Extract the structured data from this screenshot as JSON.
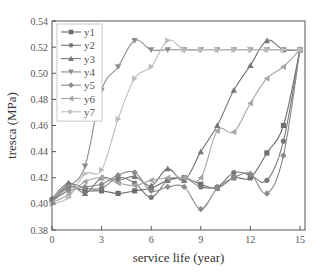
{
  "chart_data": {
    "type": "line",
    "title": "",
    "xlabel": "service life (year)",
    "ylabel": "tresca (MPa)",
    "xlim": [
      0,
      15.3
    ],
    "ylim": [
      0.38,
      0.54
    ],
    "xticks": [
      0,
      3,
      6,
      9,
      12,
      15
    ],
    "xtick_labels": [
      "0",
      "3",
      "6",
      "9",
      "12",
      "15"
    ],
    "yticks": [
      0.38,
      0.4,
      0.42,
      0.44,
      0.46,
      0.48,
      0.5,
      0.52,
      0.54
    ],
    "ytick_labels": [
      "0.38",
      "0.40",
      "0.42",
      "0.44",
      "0.46",
      "0.48",
      "0.50",
      "0.52",
      "0.54"
    ],
    "grid": false,
    "legend_position": "upper-left",
    "x": [
      0,
      1,
      2,
      3,
      4,
      5,
      6,
      7,
      8,
      9,
      10,
      11,
      12,
      13,
      14,
      15
    ],
    "series": [
      {
        "name": "y1",
        "marker": "square",
        "color": "#6e6e6e",
        "values": [
          0.403,
          0.413,
          0.41,
          0.41,
          0.408,
          0.41,
          0.412,
          0.418,
          0.42,
          0.415,
          0.412,
          0.42,
          0.42,
          0.439,
          0.46,
          0.518
        ]
      },
      {
        "name": "y2",
        "marker": "circle",
        "color": "#7a7a7a",
        "values": [
          0.402,
          0.415,
          0.412,
          0.412,
          0.42,
          0.416,
          0.405,
          0.418,
          0.42,
          0.413,
          0.413,
          0.424,
          0.422,
          0.418,
          0.448,
          0.518
        ]
      },
      {
        "name": "y3",
        "marker": "triangle-up",
        "color": "#777777",
        "values": [
          0.404,
          0.416,
          0.408,
          0.42,
          0.418,
          0.421,
          0.414,
          0.427,
          0.418,
          0.44,
          0.46,
          0.487,
          0.506,
          0.525,
          0.518,
          0.518
        ]
      },
      {
        "name": "y4",
        "marker": "triangle-down",
        "color": "#8c8c8c",
        "values": [
          0.402,
          0.413,
          0.429,
          0.487,
          0.505,
          0.525,
          0.518,
          0.518,
          0.518,
          0.518,
          0.518,
          0.518,
          0.518,
          0.518,
          0.518,
          0.518
        ]
      },
      {
        "name": "y5",
        "marker": "diamond",
        "color": "#8a8a8a",
        "values": [
          0.402,
          0.41,
          0.413,
          0.415,
          0.422,
          0.424,
          0.41,
          0.413,
          0.413,
          0.396,
          0.412,
          0.42,
          0.423,
          0.408,
          0.437,
          0.518
        ]
      },
      {
        "name": "y6",
        "marker": "triangle-left",
        "color": "#a6a6a6",
        "values": [
          0.401,
          0.407,
          0.417,
          0.42,
          0.416,
          0.414,
          0.418,
          0.42,
          0.42,
          0.42,
          0.456,
          0.455,
          0.477,
          0.496,
          0.505,
          0.518
        ]
      },
      {
        "name": "y7",
        "marker": "triangle-right",
        "color": "#bdbdbd",
        "values": [
          0.4,
          0.405,
          0.423,
          0.426,
          0.465,
          0.496,
          0.505,
          0.525,
          0.518,
          0.518,
          0.518,
          0.518,
          0.518,
          0.518,
          0.518,
          0.518
        ]
      }
    ]
  },
  "layout": {
    "plot_left": 52,
    "plot_top": 21,
    "plot_right": 305,
    "plot_bottom": 230,
    "px_per_year": 16.53
  }
}
